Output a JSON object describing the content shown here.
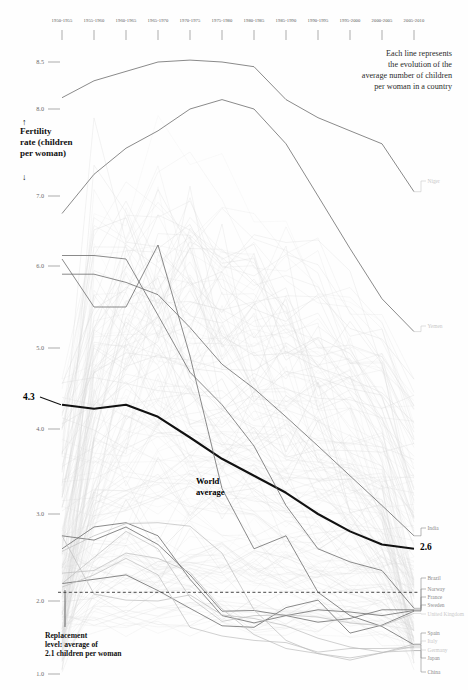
{
  "header": {
    "annotation_lines": [
      "Each line represents",
      "the evolution of the",
      "average number of children",
      "per woman in a country"
    ]
  },
  "axis": {
    "y_title_lines": [
      "Fertility",
      "rate (children",
      "per woman)"
    ],
    "y_arrow_up": "↑",
    "y_arrow_down": "↓",
    "y_ticks": [
      "8.5",
      "8.0",
      "7.0",
      "6.0",
      "5.0",
      "4.0",
      "3.0",
      "2.0",
      "1.0"
    ],
    "x_ticks": [
      "1950-1955",
      "1955-1960",
      "1960-1965",
      "1965-1970",
      "1970-1975",
      "1975-1980",
      "1980-1985",
      "1985-1990",
      "1990-1995",
      "1995-2000",
      "2000-2005",
      "2005-2010"
    ]
  },
  "annotations": {
    "world_label_lines": [
      "World",
      "average"
    ],
    "world_start_value": "4.3",
    "world_end_value": "2.6",
    "replacement_lines": [
      "Replacement",
      "level: average of",
      "2.1 children per woman"
    ]
  },
  "colors": {
    "world_line": "#111111",
    "highlight_line": "#6e6e6e",
    "faint_line": "#d8d8d8",
    "label_dark": "#8a8a8a",
    "label_light": "#c9c9c9",
    "replacement_dash": "#333333",
    "axis": "#8a8a8a",
    "background": "#fefefe"
  },
  "chart_data": {
    "type": "line",
    "title": "",
    "subtitle": "",
    "xlabel": "",
    "ylabel": "Fertility rate (children per woman)",
    "grid": false,
    "legend": "inline-right-end-labels",
    "x": [
      "1950-1955",
      "1955-1960",
      "1960-1965",
      "1965-1970",
      "1970-1975",
      "1975-1980",
      "1980-1985",
      "1985-1990",
      "1990-1995",
      "1995-2000",
      "2000-2005",
      "2005-2010"
    ],
    "xlim": [
      0,
      11
    ],
    "ylim": [
      1.0,
      8.7
    ],
    "reference_line": {
      "label": "Replacement level: average of 2.1 children per woman",
      "value": 2.1,
      "style": "dashed"
    },
    "series": [
      {
        "name": "World average",
        "emphasis": "bold",
        "label_side": "right",
        "start_label": "4.3",
        "end_label": "2.6",
        "values": [
          4.3,
          4.25,
          4.3,
          4.15,
          3.9,
          3.65,
          3.45,
          3.25,
          3.0,
          2.8,
          2.65,
          2.6
        ]
      },
      {
        "name": "Niger",
        "emphasis": "medium",
        "label_side": "right",
        "values": [
          8.12,
          8.3,
          8.4,
          8.5,
          8.52,
          8.5,
          8.45,
          8.1,
          7.9,
          7.75,
          7.6,
          7.05
        ]
      },
      {
        "name": "Yemen",
        "emphasis": "medium",
        "label_side": "right",
        "values": [
          6.75,
          7.25,
          7.55,
          7.75,
          8.0,
          8.1,
          8.0,
          7.6,
          7.0,
          6.25,
          5.6,
          5.2
        ]
      },
      {
        "name": "India",
        "emphasis": "medium",
        "label_side": "right",
        "values": [
          5.9,
          5.9,
          5.8,
          5.65,
          5.25,
          4.8,
          4.5,
          4.15,
          3.8,
          3.45,
          3.1,
          2.75
        ]
      },
      {
        "name": "Brazil",
        "emphasis": "medium",
        "label_side": "right",
        "values": [
          6.15,
          6.15,
          6.1,
          5.4,
          4.7,
          4.3,
          3.8,
          3.1,
          2.6,
          2.45,
          2.35,
          1.9
        ]
      },
      {
        "name": "China",
        "emphasis": "medium",
        "label_side": "right",
        "values": [
          6.1,
          5.5,
          5.5,
          6.3,
          4.9,
          3.3,
          2.6,
          2.75,
          2.1,
          1.8,
          1.65,
          1.4
        ]
      },
      {
        "name": "Norway",
        "emphasis": "medium",
        "label_side": "right",
        "values": [
          2.6,
          2.85,
          2.9,
          2.75,
          2.25,
          1.8,
          1.7,
          1.8,
          1.88,
          1.85,
          1.8,
          1.87
        ]
      },
      {
        "name": "France",
        "emphasis": "medium",
        "label_side": "right",
        "values": [
          2.75,
          2.7,
          2.85,
          2.65,
          2.3,
          1.86,
          1.87,
          1.8,
          1.71,
          1.76,
          1.88,
          1.88
        ]
      },
      {
        "name": "Sweden",
        "emphasis": "medium",
        "label_side": "right",
        "values": [
          2.2,
          2.25,
          2.3,
          2.12,
          1.9,
          1.66,
          1.64,
          1.91,
          2.01,
          1.56,
          1.67,
          1.86
        ]
      },
      {
        "name": "United Kingdom",
        "emphasis": "faint",
        "label_side": "right",
        "values": [
          2.2,
          2.5,
          2.8,
          2.6,
          2.04,
          1.72,
          1.8,
          1.81,
          1.78,
          1.7,
          1.66,
          1.83
        ]
      },
      {
        "name": "Spain",
        "emphasis": "faint",
        "label_side": "right",
        "values": [
          2.57,
          2.75,
          2.89,
          2.9,
          2.86,
          2.55,
          1.88,
          1.46,
          1.28,
          1.19,
          1.29,
          1.41
        ]
      },
      {
        "name": "Italy",
        "emphasis": "faint",
        "label_side": "right",
        "values": [
          2.32,
          2.35,
          2.55,
          2.49,
          2.33,
          1.89,
          1.54,
          1.35,
          1.28,
          1.22,
          1.29,
          1.38
        ]
      },
      {
        "name": "Germany",
        "emphasis": "faint",
        "label_side": "right",
        "values": [
          2.16,
          2.3,
          2.49,
          2.3,
          1.64,
          1.52,
          1.46,
          1.43,
          1.3,
          1.35,
          1.35,
          1.36
        ]
      },
      {
        "name": "Japan",
        "emphasis": "faint",
        "label_side": "right",
        "values": [
          2.75,
          2.08,
          2.01,
          2.0,
          2.07,
          1.81,
          1.76,
          1.66,
          1.49,
          1.37,
          1.3,
          1.32
        ]
      }
    ],
    "background_series_count": 160,
    "note": "Faint gray background lines represent all other countries"
  }
}
